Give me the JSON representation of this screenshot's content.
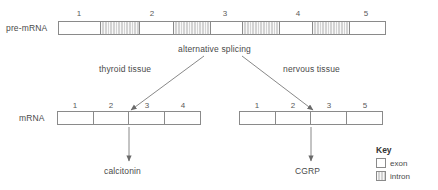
{
  "diagram": {
    "pre_mrna": {
      "label": "pre-mRNA",
      "exon_numbers": [
        "1",
        "2",
        "3",
        "4",
        "5"
      ],
      "segments": [
        {
          "type": "exon",
          "number": "1"
        },
        {
          "type": "intron",
          "number": ""
        },
        {
          "type": "exon",
          "number": "2"
        },
        {
          "type": "intron",
          "number": ""
        },
        {
          "type": "exon",
          "number": "3"
        },
        {
          "type": "intron",
          "number": ""
        },
        {
          "type": "exon",
          "number": "4"
        },
        {
          "type": "intron",
          "number": ""
        },
        {
          "type": "exon",
          "number": "5"
        }
      ]
    },
    "process_label": "alternative splicing",
    "branches": [
      {
        "tissue_label": "thyroid tissue",
        "mrna_label": "mRNA",
        "exons": [
          "1",
          "2",
          "3",
          "4"
        ],
        "product": "calcitonin"
      },
      {
        "tissue_label": "nervous tissue",
        "mrna_label": "",
        "exons": [
          "1",
          "2",
          "3",
          "5"
        ],
        "product": "CGRP"
      }
    ],
    "key": {
      "title": "Key",
      "items": [
        {
          "label": "exon",
          "type": "exon"
        },
        {
          "label": "intron",
          "type": "intron"
        }
      ]
    },
    "colors": {
      "exon_fill": "#ffffff",
      "intron_fill": "#d3d3d3",
      "stroke": "#8a8a8a",
      "text": "#4a4a4a"
    }
  }
}
